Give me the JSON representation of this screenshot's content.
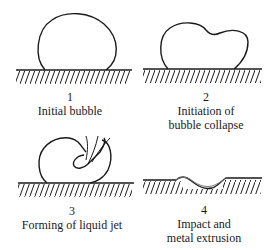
{
  "figure": {
    "stroke_color": "#1a1a1a",
    "panels": [
      {
        "number": "1",
        "caption_lines": [
          "Initial bubble"
        ]
      },
      {
        "number": "2",
        "caption_lines": [
          "Initiation of",
          "bubble collapse"
        ]
      },
      {
        "number": "3",
        "caption_lines": [
          "Forming of liquid jet"
        ]
      },
      {
        "number": "4",
        "caption_lines": [
          "Impact and",
          "metal extrusion"
        ]
      }
    ]
  }
}
